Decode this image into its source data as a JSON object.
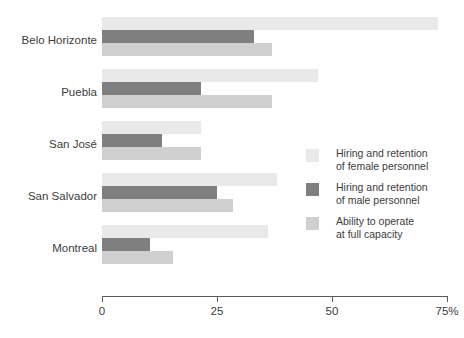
{
  "chart_data": {
    "type": "bar",
    "orientation": "horizontal",
    "title": "",
    "xlabel": "",
    "ylabel": "",
    "xlim": [
      0,
      75
    ],
    "xticks": [
      0,
      25,
      50,
      75
    ],
    "xtick_labels": [
      "0",
      "25",
      "50",
      "75%"
    ],
    "grid": false,
    "legend_position": "right-middle",
    "categories": [
      "Belo Horizonte",
      "Puebla",
      "San José",
      "San Salvador",
      "Montreal"
    ],
    "series": [
      {
        "name": "Hiring and retention of female personnel",
        "color": "#e9e9e9",
        "values": [
          73,
          47,
          21.5,
          38,
          36
        ]
      },
      {
        "name": "Hiring and retention of male personnel",
        "color": "#7f7f7f",
        "values": [
          33,
          21.5,
          13,
          25,
          10.5
        ]
      },
      {
        "name": "Ability to operate at full capacity",
        "color": "#cfcfcf",
        "values": [
          37,
          37,
          21.5,
          28.5,
          15.5
        ]
      }
    ]
  },
  "legend": {
    "items": [
      {
        "line1": "Hiring and retention",
        "line2": "of female personnel",
        "swatch": "#e9e9e9"
      },
      {
        "line1": "Hiring and retention",
        "line2": "of male personnel",
        "swatch": "#7f7f7f"
      },
      {
        "line1": "Ability to operate",
        "line2": "at full capacity",
        "swatch": "#cfcfcf"
      }
    ]
  },
  "axis": {
    "unit_suffix": "%"
  }
}
